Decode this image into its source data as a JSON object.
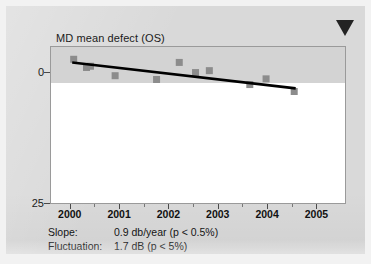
{
  "chart_data": {
    "type": "scatter",
    "title": "MD mean defect (OS)",
    "xlabel": "",
    "ylabel": "",
    "xlim": [
      1999.6,
      2005.6
    ],
    "ylim": [
      0,
      25
    ],
    "y_inverted": true,
    "grid": false,
    "legend": "none",
    "y_ticks": [
      "0",
      "25"
    ],
    "y_tick_values": [
      0,
      25
    ],
    "x_ticks": [
      "2000",
      "2001",
      "2002",
      "2003",
      "2004",
      "2005"
    ],
    "x_tick_values": [
      2000,
      2001,
      2002,
      2003,
      2004,
      2005
    ],
    "x_minor_tick_values": [
      2000.5,
      2001.5,
      2002.5,
      2003.5,
      2004.5
    ],
    "normal_band": {
      "label": "normal-range-band",
      "y_from": 0,
      "y_to": 5.7,
      "color": "#d3d3d3"
    },
    "series": [
      {
        "name": "MD measurements",
        "type": "scatter",
        "marker": "square",
        "color": "#8c8c8c",
        "points": [
          {
            "x": 2000.08,
            "y": 2.1
          },
          {
            "x": 2000.34,
            "y": 3.4
          },
          {
            "x": 2000.42,
            "y": 3.2
          },
          {
            "x": 2000.92,
            "y": 4.7
          },
          {
            "x": 2001.76,
            "y": 5.3
          },
          {
            "x": 2002.22,
            "y": 2.6
          },
          {
            "x": 2002.55,
            "y": 4.2
          },
          {
            "x": 2002.83,
            "y": 3.9
          },
          {
            "x": 2003.65,
            "y": 6.1
          },
          {
            "x": 2003.98,
            "y": 5.2
          },
          {
            "x": 2004.55,
            "y": 7.2
          }
        ]
      },
      {
        "name": "Regression trend line",
        "type": "line",
        "color": "#000000",
        "points": [
          {
            "x": 2000.05,
            "y": 2.6
          },
          {
            "x": 2004.58,
            "y": 6.7
          }
        ]
      }
    ],
    "annotations": [
      {
        "name": "progression-flag-triangle",
        "shape": "triangle-down",
        "color": "#232323"
      }
    ]
  },
  "stats": {
    "slope_label": "Slope:",
    "slope_value": "0.9 db/year (p < 0.5%)",
    "fluctuation_label": "Fluctuation:",
    "fluctuation_value": "1.7 dB (p < 5%)"
  },
  "colors": {
    "panel_background": "#d9d9d9",
    "plot_background": "#ffffff",
    "band": "#d3d3d3",
    "marker": "#8c8c8c",
    "trend_line": "#000000",
    "flag": "#232323",
    "axis": "#9a9a9a",
    "text": "#141414"
  }
}
